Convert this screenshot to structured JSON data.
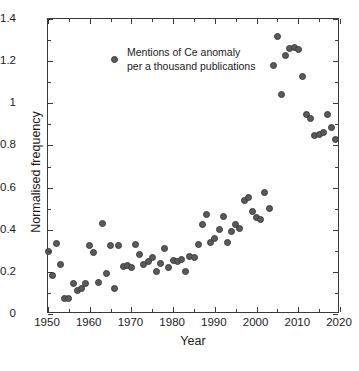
{
  "chart_data": {
    "type": "scatter",
    "title": "",
    "xlabel": "Year",
    "ylabel": "Normalised frequency",
    "xlim": [
      1950,
      2020
    ],
    "ylim": [
      0,
      1.4
    ],
    "xticks": [
      1950,
      1960,
      1970,
      1980,
      1990,
      2000,
      2010,
      2020
    ],
    "xticklabels": [
      "1950",
      "1960",
      "1970",
      "1980",
      "1990",
      "2000",
      "2010",
      "2020"
    ],
    "yticks": [
      0,
      0.2,
      0.4,
      0.6,
      0.8,
      1,
      1.2,
      1.4
    ],
    "yticklabels": [
      "0",
      "0.2",
      "0.4",
      "0.6",
      "0.8",
      "1",
      "1.2",
      "1.4"
    ],
    "grid": false,
    "legend_position": "upper left",
    "marker_color": "#5a5a5a",
    "marker_edge_color": "#3c3c3c",
    "axis_color": "#3a3a3a",
    "series": [
      {
        "name": "Mentions of Ce anomaly per a thousand publications",
        "legend_line_1": "Mentions of Ce anomaly",
        "legend_line_2": "per a thousand publications",
        "x": [
          1950,
          1951,
          1952,
          1953,
          1954,
          1955,
          1956,
          1957,
          1958,
          1959,
          1960,
          1961,
          1962,
          1963,
          1964,
          1965,
          1966,
          1967,
          1968,
          1969,
          1970,
          1971,
          1972,
          1973,
          1974,
          1975,
          1976,
          1977,
          1978,
          1979,
          1980,
          1981,
          1982,
          1983,
          1984,
          1985,
          1986,
          1987,
          1988,
          1989,
          1990,
          1991,
          1992,
          1993,
          1994,
          1995,
          1996,
          1997,
          1998,
          1999,
          2000,
          2001,
          2002,
          2003,
          2004,
          2005,
          2006,
          2007,
          2008,
          2009,
          2010,
          2011,
          2012,
          2013,
          2014,
          2015,
          2016,
          2017,
          2018,
          2019
        ],
        "y": [
          0.295,
          0.182,
          0.336,
          0.235,
          0.074,
          0.072,
          0.143,
          0.113,
          0.121,
          0.143,
          0.323,
          0.292,
          0.151,
          0.431,
          0.194,
          0.323,
          0.121,
          0.323,
          0.224,
          0.228,
          0.222,
          0.329,
          0.281,
          0.237,
          0.249,
          0.267,
          0.201,
          0.24,
          0.313,
          0.221,
          0.256,
          0.25,
          0.259,
          0.2,
          0.275,
          0.268,
          0.331,
          0.427,
          0.474,
          0.338,
          0.356,
          0.4,
          0.463,
          0.341,
          0.391,
          0.425,
          0.404,
          0.54,
          0.553,
          0.487,
          0.456,
          0.447,
          0.578,
          0.503,
          1.18,
          1.319,
          1.04,
          1.229,
          1.259,
          1.265,
          1.256,
          1.127,
          0.946,
          0.928,
          0.849,
          0.853,
          0.862,
          0.946,
          0.884,
          0.828
        ]
      }
    ]
  }
}
